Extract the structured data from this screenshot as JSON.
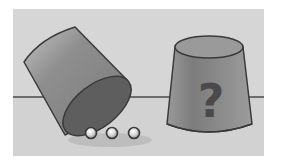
{
  "scene": {
    "description": "Two cups on a table; left cup tipped over revealing three balls, right cup upright with a question mark",
    "colors": {
      "background": "#ffffff",
      "panel": "#d6d6d6",
      "table_line": "#4a4a4a",
      "cup_fill": "#8c8c8c",
      "cup_dark": "#5e5e5e",
      "cup_light": "#b5b5b5",
      "outline": "#3a3a3a",
      "ball": "#e6e6e6"
    },
    "left_cup": {
      "state": "tipped",
      "balls_count": 3
    },
    "right_cup": {
      "state": "upright",
      "label": "?"
    }
  }
}
